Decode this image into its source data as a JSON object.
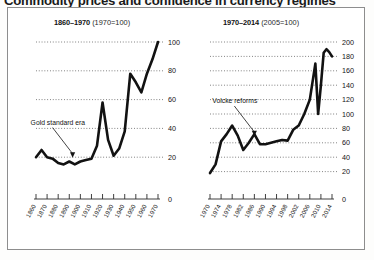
{
  "headline": "Commodity prices and confidence in currency regimes",
  "panels": {
    "left": {
      "title_bold": "1860–1970",
      "title_note": "(1970=100)",
      "annotation": "Gold standard era"
    },
    "right": {
      "title_bold": "1970–2014",
      "title_note": "(2005=100)",
      "annotation": "Volcke reforms"
    }
  },
  "chart_data": [
    {
      "type": "line",
      "title": "1860–1970 (1970=100)",
      "xlabel": "",
      "ylabel": "",
      "xlim": [
        1860,
        1970
      ],
      "ylim": [
        0,
        100
      ],
      "yticks": [
        0,
        20,
        40,
        60,
        80,
        100
      ],
      "xticks": [
        1860,
        1870,
        1880,
        1890,
        1900,
        1910,
        1920,
        1930,
        1940,
        1950,
        1960,
        1970
      ],
      "grid": true,
      "legend": "none",
      "annotations": [
        {
          "text": "Gold standard era",
          "x": 1893,
          "y": 19
        }
      ],
      "series": [
        {
          "name": "Commodity price index (1970=100)",
          "x": [
            1860,
            1865,
            1870,
            1875,
            1880,
            1885,
            1890,
            1895,
            1900,
            1905,
            1910,
            1915,
            1920,
            1925,
            1930,
            1935,
            1940,
            1945,
            1950,
            1955,
            1960,
            1965,
            1970
          ],
          "values": [
            20,
            25,
            20,
            19,
            16,
            15,
            17,
            15,
            17,
            18,
            19,
            28,
            58,
            32,
            21,
            26,
            38,
            78,
            72,
            65,
            78,
            88,
            100
          ]
        }
      ]
    },
    {
      "type": "line",
      "title": "1970–2014 (2005=100)",
      "xlabel": "",
      "ylabel": "",
      "xlim": [
        1970,
        2014
      ],
      "ylim": [
        0,
        200
      ],
      "yticks": [
        0,
        20,
        40,
        60,
        80,
        100,
        120,
        140,
        160,
        180,
        200
      ],
      "xticks": [
        1970,
        1974,
        1978,
        1982,
        1986,
        1990,
        1994,
        1998,
        2002,
        2006,
        2010,
        2014
      ],
      "grid": true,
      "legend": "none",
      "annotations": [
        {
          "text": "Volcke reforms",
          "x": 1986,
          "y": 68
        }
      ],
      "series": [
        {
          "name": "Commodity price index (2005=100)",
          "x": [
            1970,
            1972,
            1974,
            1976,
            1978,
            1980,
            1982,
            1984,
            1986,
            1988,
            1990,
            1992,
            1994,
            1996,
            1998,
            2000,
            2002,
            2004,
            2006,
            2008,
            2009,
            2010,
            2011,
            2012,
            2013,
            2014
          ],
          "values": [
            18,
            30,
            62,
            72,
            84,
            70,
            50,
            60,
            72,
            58,
            58,
            60,
            62,
            64,
            63,
            78,
            84,
            100,
            120,
            170,
            100,
            140,
            185,
            190,
            186,
            180
          ]
        }
      ]
    }
  ]
}
